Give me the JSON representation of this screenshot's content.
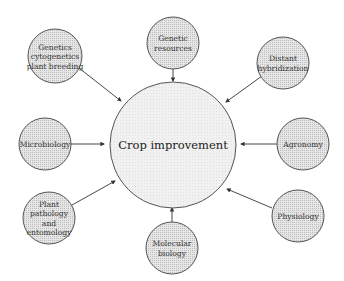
{
  "diagram": {
    "type": "hub-and-spoke",
    "center": {
      "label": "Crop improvement",
      "cx": 173,
      "cy": 145,
      "r": 63
    },
    "colors": {
      "stroke": "#555555",
      "center_fill": "#eeeeee",
      "node_fill": "#dddddd",
      "arrow": "#333333"
    },
    "nodes": [
      {
        "id": "genetics",
        "lines": [
          "Genetics",
          "cytogenetics",
          "plant breeding"
        ],
        "cx": 55,
        "cy": 56,
        "r": 27,
        "arrow": {
          "x1": 79,
          "y1": 68,
          "x2": 121,
          "y2": 101
        }
      },
      {
        "id": "genetic-resources",
        "lines": [
          "Genetic",
          "resources"
        ],
        "cx": 173,
        "cy": 43,
        "r": 26,
        "arrow": {
          "x1": 173,
          "y1": 69,
          "x2": 173,
          "y2": 81
        }
      },
      {
        "id": "distant-hybridization",
        "lines": [
          "Distant",
          "hybridization"
        ],
        "cx": 283,
        "cy": 63,
        "r": 26,
        "arrow": {
          "x1": 262,
          "y1": 76,
          "x2": 226,
          "y2": 102
        }
      },
      {
        "id": "microbiology",
        "lines": [
          "Microbiology"
        ],
        "cx": 45,
        "cy": 144,
        "r": 26,
        "arrow": {
          "x1": 71,
          "y1": 144,
          "x2": 104,
          "y2": 144
        }
      },
      {
        "id": "agronomy",
        "lines": [
          "Agronomy"
        ],
        "cx": 303,
        "cy": 144,
        "r": 26,
        "arrow": {
          "x1": 277,
          "y1": 144,
          "x2": 241,
          "y2": 144
        }
      },
      {
        "id": "plant-pathology",
        "lines": [
          "Plant",
          "pathology",
          "and",
          "entomology"
        ],
        "cx": 49,
        "cy": 218,
        "r": 26,
        "arrow": {
          "x1": 72,
          "y1": 205,
          "x2": 115,
          "y2": 181
        }
      },
      {
        "id": "molecular-biology",
        "lines": [
          "Molecular",
          "biology"
        ],
        "cx": 172,
        "cy": 248,
        "r": 26,
        "arrow": {
          "x1": 172,
          "y1": 222,
          "x2": 172,
          "y2": 208
        }
      },
      {
        "id": "physiology",
        "lines": [
          "Physiology"
        ],
        "cx": 298,
        "cy": 216,
        "r": 26,
        "arrow": {
          "x1": 272,
          "y1": 208,
          "x2": 227,
          "y2": 189
        }
      }
    ]
  }
}
